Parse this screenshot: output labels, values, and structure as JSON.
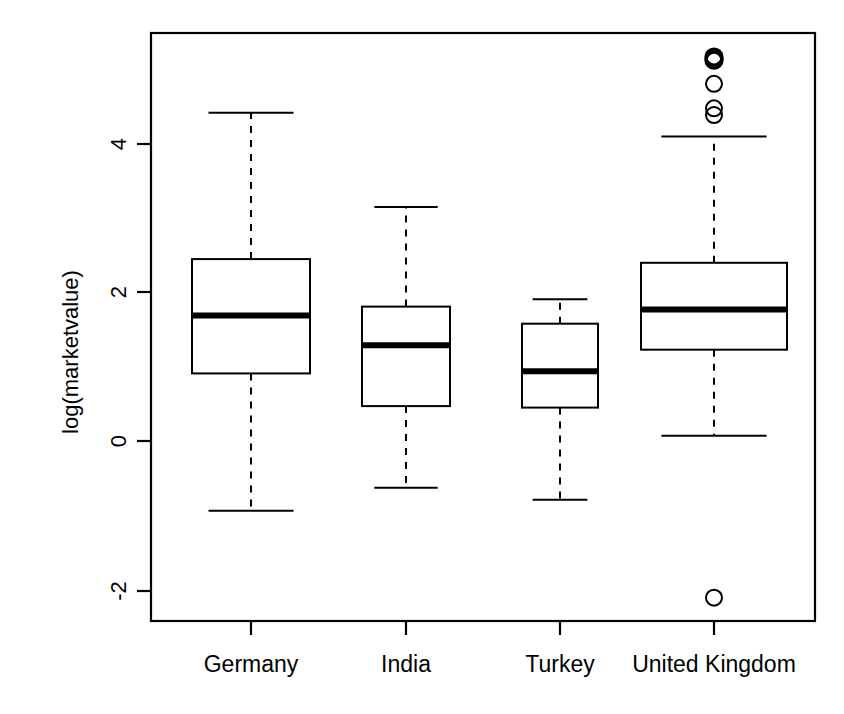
{
  "chart_data": {
    "type": "box",
    "title": "",
    "xlabel": "",
    "ylabel": "log(marketvalue)",
    "categories": [
      "Germany",
      "India",
      "Turkey",
      "United Kingdom"
    ],
    "ylim": [
      -2.6,
      5.4
    ],
    "yticks": [
      -2,
      0,
      2,
      4
    ],
    "ytick_labels": [
      "-2",
      "0",
      "2",
      "4"
    ],
    "grid": false,
    "legend": "none",
    "boxes": [
      {
        "name": "Germany",
        "whisker_low": -0.94,
        "q1": 0.91,
        "median": 1.69,
        "q3": 2.45,
        "whisker_high": 4.42,
        "outliers": []
      },
      {
        "name": "India",
        "whisker_low": -0.63,
        "q1": 0.47,
        "median": 1.29,
        "q3": 1.81,
        "whisker_high": 3.15,
        "outliers": []
      },
      {
        "name": "Turkey",
        "whisker_low": -0.79,
        "q1": 0.45,
        "median": 0.94,
        "q3": 1.58,
        "whisker_high": 1.91,
        "outliers": []
      },
      {
        "name": "United Kingdom",
        "whisker_low": 0.07,
        "q1": 1.23,
        "median": 1.77,
        "q3": 2.4,
        "whisker_high": 4.1,
        "outliers": [
          5.17,
          5.13,
          4.81,
          4.48,
          4.39,
          -2.11
        ]
      }
    ]
  },
  "style": {
    "line_color": "#000000",
    "box_fill": "#ffffff",
    "background": "#ffffff"
  }
}
